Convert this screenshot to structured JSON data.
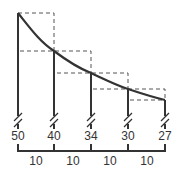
{
  "diagram": {
    "type": "curve-with-step-rectangles",
    "colors": {
      "line": "#333333",
      "dashed": "#555555",
      "background": "#ffffff"
    },
    "ordinates": [
      {
        "label": "50",
        "x": 18,
        "y_top": 13
      },
      {
        "label": "40",
        "x": 54,
        "y_top": 51
      },
      {
        "label": "34",
        "x": 91,
        "y_top": 73
      },
      {
        "label": "30",
        "x": 128,
        "y_top": 89
      },
      {
        "label": "27",
        "x": 165,
        "y_top": 100
      }
    ],
    "intervals": [
      {
        "label": "10",
        "x": 36
      },
      {
        "label": "10",
        "x": 73
      },
      {
        "label": "10",
        "x": 110
      },
      {
        "label": "10",
        "x": 147
      }
    ],
    "baseline_y": 151,
    "label_y": 130,
    "interval_label_y": 155
  }
}
